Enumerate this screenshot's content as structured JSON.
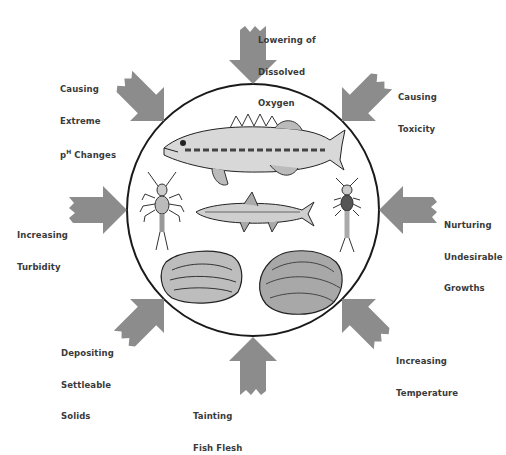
{
  "diagram": {
    "center": {
      "shape": "circle",
      "organisms": [
        {
          "name": "bass-fish",
          "kind": "fish"
        },
        {
          "name": "mayfly-nymph-left",
          "kind": "insect larva"
        },
        {
          "name": "minnow",
          "kind": "fish"
        },
        {
          "name": "stonefly-nymph-right",
          "kind": "insect larva"
        },
        {
          "name": "oyster",
          "kind": "shellfish"
        },
        {
          "name": "clam",
          "kind": "shellfish"
        }
      ]
    },
    "colors": {
      "arrow": "#8c8c8c",
      "circle_stroke": "#1a1a1a",
      "text": "#3a3a3a",
      "background": "#ffffff"
    },
    "effects": [
      {
        "id": "top",
        "line1": "Lowering of",
        "line2": "Dissolved",
        "line3": "Oxygen"
      },
      {
        "id": "top-left",
        "line1": "Causing",
        "line2": "Extreme",
        "line3_pre": "p",
        "line3_sup": "H",
        "line3_post": " Changes"
      },
      {
        "id": "top-right",
        "line1": "Causing",
        "line2": "Toxicity",
        "line3": ""
      },
      {
        "id": "left",
        "line1": "Increasing",
        "line2": "Turbidity",
        "line3": ""
      },
      {
        "id": "right",
        "line1": "Nurturing",
        "line2": "Undesirable",
        "line3": "Growths"
      },
      {
        "id": "bottom-left",
        "line1": "Depositing",
        "line2": "Settleable",
        "line3": "Solids"
      },
      {
        "id": "bottom-right",
        "line1": "Increasing",
        "line2": "Temperature",
        "line3": ""
      },
      {
        "id": "bottom",
        "line1": "Tainting",
        "line2": "Fish Flesh",
        "line3": ""
      }
    ]
  }
}
